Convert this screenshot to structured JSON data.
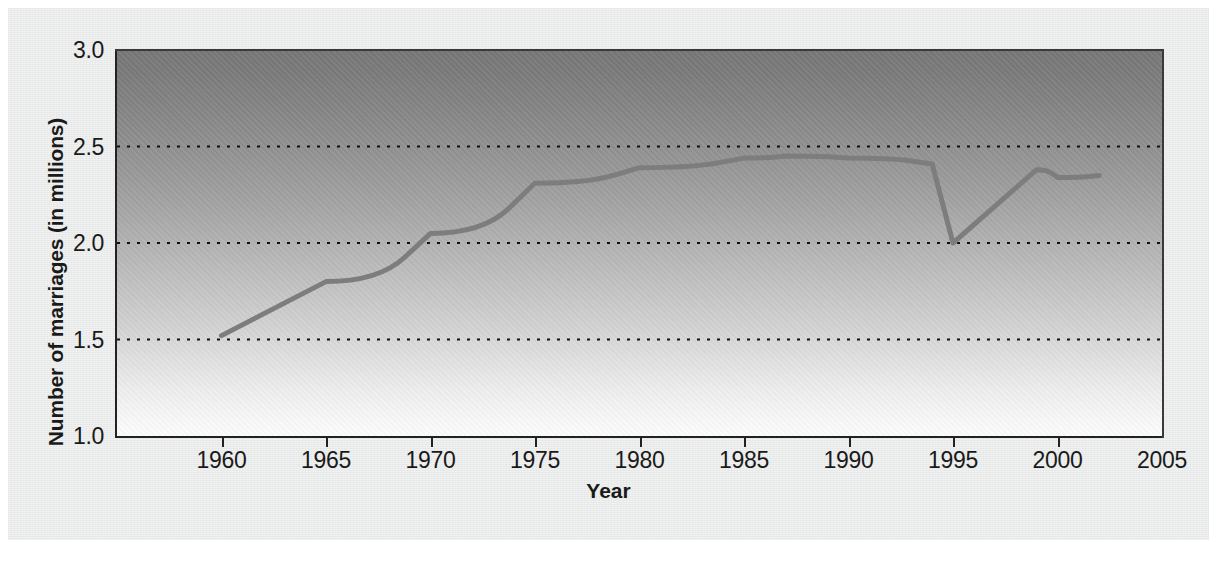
{
  "chart_data": {
    "type": "line",
    "title": "",
    "xlabel": "Year",
    "ylabel": "Number of marriages (in millions)",
    "xlim": [
      1955,
      2005
    ],
    "ylim": [
      1.0,
      3.0
    ],
    "xticks": [
      1960,
      1965,
      1970,
      1975,
      1980,
      1985,
      1990,
      1995,
      2000,
      2005
    ],
    "xticklabels": [
      "1960",
      "1965",
      "1970",
      "1975",
      "1980",
      "1985",
      "1990",
      "1995",
      "2000",
      "2005"
    ],
    "yticks": [
      1.0,
      1.5,
      2.0,
      2.5,
      3.0
    ],
    "yticklabels": [
      "1.0",
      "1.5",
      "2.0",
      "2.5",
      "3.0"
    ],
    "grid": "horizontal-dotted",
    "gridlines_at": [
      1.5,
      2.0,
      2.5
    ],
    "legend": "none",
    "line_color": "#7d7d7d",
    "series": [
      {
        "name": "Number of marriages (in millions)",
        "x": [
          1960,
          1965,
          1970,
          1975,
          1980,
          1985,
          1987,
          1990,
          1994,
          1995,
          1999,
          2000,
          2002
        ],
        "values": [
          1.52,
          1.8,
          2.05,
          2.31,
          2.39,
          2.44,
          2.45,
          2.44,
          2.41,
          2.0,
          2.38,
          2.34,
          2.35
        ]
      }
    ],
    "annotations": [
      "Sharp drop between 1994 and 1995 from about 2.4 to 2.0 million",
      "Plateau near 2.45 million between 1985 and 1990"
    ]
  },
  "axes": {
    "y_title": "Number of marriages (in millions)",
    "x_title": "Year"
  }
}
